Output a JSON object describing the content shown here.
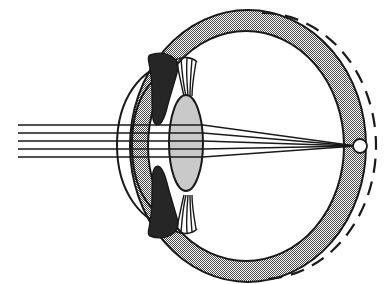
{
  "diagram": {
    "title": "Eye cross-section with light refraction",
    "background_color": "#ffffff",
    "ink_color": "#1a1a1a",
    "colors": {
      "sclera_fill": "#8d8d8d",
      "iris_fill": "#262626",
      "lens_fill": "#c9c9c9",
      "outline": "#1a1a1a",
      "background": "#ffffff",
      "vitreous_fill": "#ffffff"
    },
    "parts": [
      {
        "name": "sclera",
        "label": "Sclera",
        "kind": "ring"
      },
      {
        "name": "retina",
        "label": "Retina",
        "kind": "dashed-arc"
      },
      {
        "name": "cornea",
        "label": "Cornea",
        "kind": "arc"
      },
      {
        "name": "anterior-chamber",
        "label": "Anterior chamber",
        "kind": "arc"
      },
      {
        "name": "iris-upper",
        "label": "Iris (upper)",
        "kind": "filled-shape"
      },
      {
        "name": "iris-lower",
        "label": "Iris (lower)",
        "kind": "filled-shape"
      },
      {
        "name": "lens",
        "label": "Lens",
        "kind": "ellipse"
      },
      {
        "name": "ciliary-zonules-upper",
        "label": "Suspensory ligaments (upper)",
        "kind": "fibers"
      },
      {
        "name": "ciliary-zonules-lower",
        "label": "Suspensory ligaments (lower)",
        "kind": "fibers"
      },
      {
        "name": "focal-point",
        "label": "Focal point on retina",
        "kind": "circle"
      },
      {
        "name": "light-rays",
        "label": "Incoming parallel light rays",
        "kind": "lines"
      }
    ],
    "geometry": {
      "globe_center_x": 248,
      "globe_center_y": 146,
      "globe_outer_rx": 118,
      "globe_outer_ry": 136,
      "globe_inner_rx": 98,
      "globe_inner_ry": 115,
      "lens_cx": 186,
      "lens_cy": 143,
      "lens_rx": 17,
      "lens_ry": 48,
      "focal_x": 360,
      "focal_y": 146,
      "focal_r": 7
    },
    "light_rays": {
      "count": 5,
      "entry_x": 18,
      "entry_y_values": [
        125,
        133,
        141,
        149,
        157
      ],
      "converge_x": 356,
      "converge_y": 146,
      "lens_exit_x": 203
    },
    "focal_point": {
      "radius": 7,
      "cx": 360,
      "cy": 146
    }
  }
}
